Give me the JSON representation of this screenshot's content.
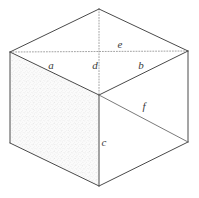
{
  "figure": {
    "type": "line-diagram",
    "background_color": "#ffffff",
    "stroke_color": "#4a4a4a",
    "hidden_stroke_color": "#8a8a8a",
    "shade_color": "#efefef",
    "label_color": "#3b3b3b"
  },
  "labels": {
    "a": "a",
    "b": "b",
    "c": "c",
    "d": "d",
    "e": "e",
    "f": "f"
  },
  "label_positions": {
    "a": {
      "x": 51,
      "y": 69
    },
    "b": {
      "x": 141,
      "y": 69
    },
    "c": {
      "x": 104,
      "y": 146
    },
    "d": {
      "x": 95,
      "y": 69
    },
    "e": {
      "x": 120,
      "y": 48
    },
    "f": {
      "x": 144,
      "y": 110
    }
  },
  "vertices": {
    "top_back": {
      "x": 99,
      "y": 9
    },
    "left": {
      "x": 10,
      "y": 52
    },
    "right": {
      "x": 188,
      "y": 51
    },
    "center_front_top": {
      "x": 99,
      "y": 95
    },
    "bottom_left": {
      "x": 10,
      "y": 143
    },
    "bottom_right": {
      "x": 188,
      "y": 142
    },
    "bottom_front": {
      "x": 99,
      "y": 186
    }
  },
  "edges": [
    {
      "name": "top-left-back",
      "style": "solid",
      "from": "left",
      "to": "top_back"
    },
    {
      "name": "top-right-back",
      "style": "solid",
      "from": "top_back",
      "to": "right"
    },
    {
      "name": "top-left-front",
      "style": "solid",
      "from": "left",
      "to": "center_front_top"
    },
    {
      "name": "top-right-front",
      "style": "solid",
      "from": "center_front_top",
      "to": "right"
    },
    {
      "name": "vertical-back-hidden",
      "style": "dotted",
      "from": "top_back",
      "to": "center_front_top"
    },
    {
      "name": "horizontal-diagonal-hidden",
      "style": "dotted",
      "from": "left",
      "to": "right"
    },
    {
      "name": "left-vertical",
      "style": "solid",
      "from": "left",
      "to": "bottom_left"
    },
    {
      "name": "right-vertical",
      "style": "solid",
      "from": "right",
      "to": "bottom_right"
    },
    {
      "name": "front-vertical",
      "style": "solid",
      "from": "center_front_top",
      "to": "bottom_front"
    },
    {
      "name": "bottom-left-front",
      "style": "solid",
      "from": "bottom_left",
      "to": "bottom_front"
    },
    {
      "name": "bottom-right-front",
      "style": "solid",
      "from": "bottom_front",
      "to": "bottom_right"
    },
    {
      "name": "right-face-diagonal",
      "style": "solid-soft",
      "from": "center_front_top",
      "to": "bottom_right"
    }
  ],
  "faces": [
    {
      "name": "top-face",
      "shading": "none"
    },
    {
      "name": "left-face",
      "shading": "stipple"
    },
    {
      "name": "right-face",
      "shading": "none"
    }
  ]
}
